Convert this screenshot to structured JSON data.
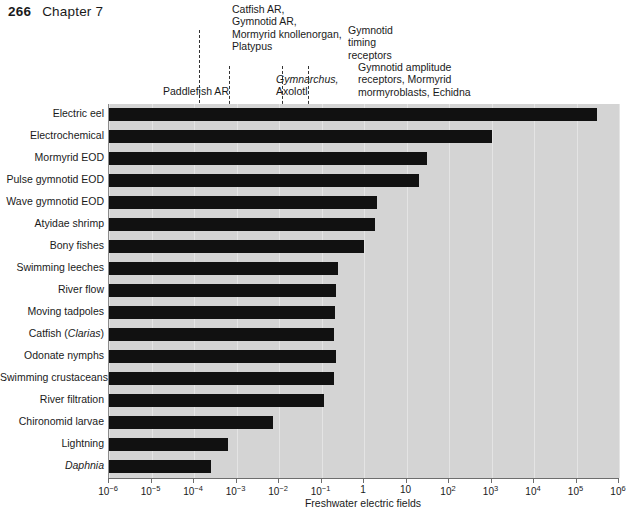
{
  "page": {
    "number": "266",
    "chapter": "Chapter 7"
  },
  "axis": {
    "title": "Freshwater electric fields",
    "tick_labels": [
      "10-6",
      "10-5",
      "10-4",
      "10-3",
      "10-2",
      "10-1",
      "1",
      "10",
      "102",
      "103",
      "104",
      "105",
      "106"
    ],
    "tick_mantissas": [
      "10",
      "10",
      "10",
      "10",
      "10",
      "10",
      "1",
      "10",
      "10",
      "10",
      "10",
      "10",
      "10"
    ],
    "tick_exponents": [
      "-6",
      "-5",
      "-4",
      "-3",
      "-2",
      "-1",
      "",
      "",
      "2",
      "3",
      "4",
      "5",
      "6"
    ],
    "min_exponent": -6,
    "max_exponent": 6
  },
  "annotations": [
    {
      "id": "catfish-group",
      "lines": [
        "Catfish AR,",
        "Gymnotid AR,",
        "Mormyrid knollenorgan,",
        "Platypus"
      ],
      "value_exponent": -2.6
    },
    {
      "id": "gymnarchus-group",
      "lines": [
        "Gymnarchus,",
        "Axolotl"
      ],
      "italic_first_line": true,
      "value_exponent": -1.9
    },
    {
      "id": "gymnotid-timing",
      "lines": [
        "Gymnotid",
        "timing",
        "receptors"
      ],
      "value_exponent": -0.65
    },
    {
      "id": "gymnotid-amplitude",
      "lines": [
        "Gymnotid amplitude",
        "receptors, Mormyrid",
        "mormyroblasts, Echidna"
      ],
      "value_exponent": 0
    },
    {
      "id": "paddlefish",
      "lines": [
        "Paddlefish AR"
      ],
      "value_exponent": -4.0
    }
  ],
  "chart_data": {
    "type": "bar",
    "orientation": "horizontal",
    "log_scale": true,
    "title": "",
    "xlabel": "Freshwater electric fields",
    "ylabel": "",
    "xlim": [
      1e-06,
      1000000.0
    ],
    "grid": true,
    "legend": null,
    "categories": [
      "Electric eel",
      "Electrochemical",
      "Mormyrid EOD",
      "Pulse gymnotid EOD",
      "Wave gymnotid EOD",
      "Atyidae shrimp",
      "Bony fishes",
      "Swimming leeches",
      "River flow",
      "Moving tadpoles",
      "Catfish (Clarias)",
      "Odonate nymphs",
      "Swimming crustaceans",
      "River filtration",
      "Chironomid larvae",
      "Lightning",
      "Daphnia"
    ],
    "categories_html": [
      "Electric eel",
      "Electrochemical",
      "Mormyrid EOD",
      "Pulse gymnotid EOD",
      "Wave gymnotid EOD",
      "Atyidae shrimp",
      "Bony fishes",
      "Swimming leeches",
      "River flow",
      "Moving tadpoles",
      "Catfish (<i>Clarias</i>)",
      "Odonate nymphs",
      "Swimming crustaceans",
      "River filtration",
      "Chironomid larvae",
      "Lightning",
      "<i>Daphnia</i>"
    ],
    "values": [
      300000.0,
      1000.0,
      30.0,
      20.0,
      2.0,
      1.8,
      1.0,
      0.24,
      0.22,
      0.21,
      0.2,
      0.22,
      0.2,
      0.12,
      0.007,
      0.0006,
      0.00025
    ],
    "value_exponents": [
      5.48,
      3.0,
      1.48,
      1.3,
      0.3,
      0.26,
      0.0,
      -0.62,
      -0.66,
      -0.68,
      -0.7,
      -0.66,
      -0.7,
      -0.93,
      -2.15,
      -3.2,
      -3.6
    ],
    "reference_lines_exponents": [
      -3.85,
      -3.15,
      -1.9,
      -1.3
    ]
  }
}
